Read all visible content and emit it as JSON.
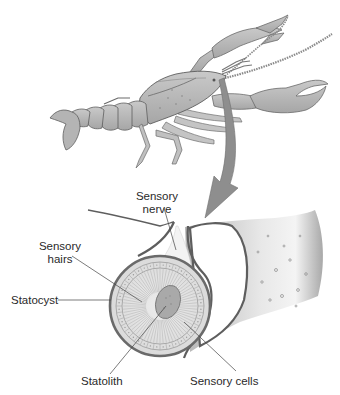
{
  "figure": {
    "organism_label": "crayfish",
    "colors": {
      "outline": "#5e5e5e",
      "body_fill": "#b9b9b9",
      "body_light": "#d4d4d4",
      "arrow": "#8e8e8e",
      "leader_line": "#444444",
      "text": "#2a2a2a",
      "cyst_wall": "#6a6a6a",
      "statolith": "#a9a9a9"
    }
  },
  "labels": {
    "sensory_nerve": {
      "line1": "Sensory",
      "line2": "nerve"
    },
    "sensory_hairs": {
      "line1": "Sensory",
      "line2": "hairs"
    },
    "statocyst": "Statocyst",
    "statolith": "Statolith",
    "sensory_cells": "Sensory cells"
  }
}
